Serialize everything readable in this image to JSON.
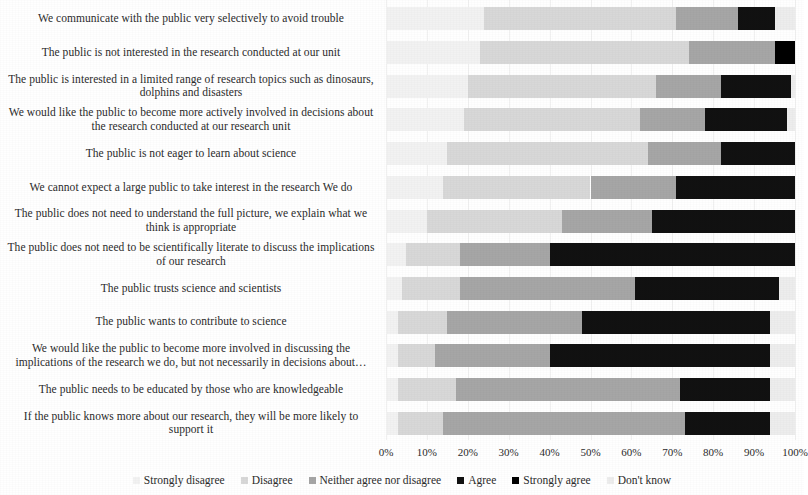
{
  "chart_data": {
    "type": "bar",
    "subtype": "stacked-horizontal-100pct",
    "title": "",
    "xlabel": "",
    "ylabel": "",
    "xlim": [
      0,
      100
    ],
    "xticks": [
      "0%",
      "10%",
      "20%",
      "30%",
      "40%",
      "50%",
      "60%",
      "70%",
      "80%",
      "90%",
      "100%"
    ],
    "xtick_values": [
      0,
      10,
      20,
      30,
      40,
      50,
      60,
      70,
      80,
      90,
      100
    ],
    "grid": true,
    "legend_position": "bottom",
    "series": [
      {
        "name": "Strongly disagree",
        "color": "#f2f2f2"
      },
      {
        "name": "Disagree",
        "color": "#d8d8d8"
      },
      {
        "name": "Neither agree nor disagree",
        "color": "#a6a6a6"
      },
      {
        "name": "Agree",
        "color": "#111111"
      },
      {
        "name": "Strongly agree",
        "color": "#000000"
      },
      {
        "name": "Don't know",
        "color": "#ededed"
      }
    ],
    "categories": [
      "We communicate with the public very selectively to avoid trouble",
      "The public is not interested in the research conducted at our unit",
      "The public is interested in a limited range of research topics such as dinosaurs, dolphins and disasters",
      "We would like the public to become more actively involved in decisions about the research conducted at our research unit",
      "The public is not eager to learn about science",
      "We cannot expect a large public to take interest in the research We do",
      "The public does not need to understand the full picture, we explain what we think is appropriate",
      "The public does not need to be scientifically literate to discuss the implications of our research",
      "The public trusts science and scientists",
      "The public wants to contribute to science",
      "We would like the public to become more involved in discussing the implications of the research we do, but not necessarily in decisions about…",
      "The public needs to be educated by those who are knowledgeable",
      "If the public knows more about our research, they will be more likely to support it"
    ],
    "values": [
      [
        24,
        47,
        15,
        9,
        0,
        5
      ],
      [
        23,
        51,
        21,
        0,
        5,
        0
      ],
      [
        20,
        46,
        16,
        17,
        0,
        1
      ],
      [
        19,
        43,
        16,
        20,
        0,
        2
      ],
      [
        15,
        49,
        18,
        18,
        0,
        0
      ],
      [
        14,
        36,
        21,
        29,
        0,
        0
      ],
      [
        10,
        33,
        22,
        35,
        0,
        0
      ],
      [
        5,
        13,
        22,
        60,
        0,
        0
      ],
      [
        4,
        14,
        43,
        35,
        0,
        4
      ],
      [
        3,
        12,
        33,
        46,
        0,
        6
      ],
      [
        3,
        9,
        28,
        54,
        0,
        6
      ],
      [
        3,
        14,
        55,
        22,
        0,
        6
      ],
      [
        3,
        11,
        59,
        21,
        0,
        6
      ]
    ]
  },
  "axis": {
    "ticks": [
      "0%",
      "10%",
      "20%",
      "30%",
      "40%",
      "50%",
      "60%",
      "70%",
      "80%",
      "90%",
      "100%"
    ]
  },
  "legend": {
    "items": [
      {
        "label": "Strongly disagree",
        "color": "#f2f2f2"
      },
      {
        "label": "Disagree",
        "color": "#d8d8d8"
      },
      {
        "label": "Neither agree nor disagree",
        "color": "#a6a6a6"
      },
      {
        "label": "Agree",
        "color": "#111111"
      },
      {
        "label": "Strongly agree",
        "color": "#000000"
      },
      {
        "label": "Don't know",
        "color": "#ededed"
      }
    ]
  }
}
